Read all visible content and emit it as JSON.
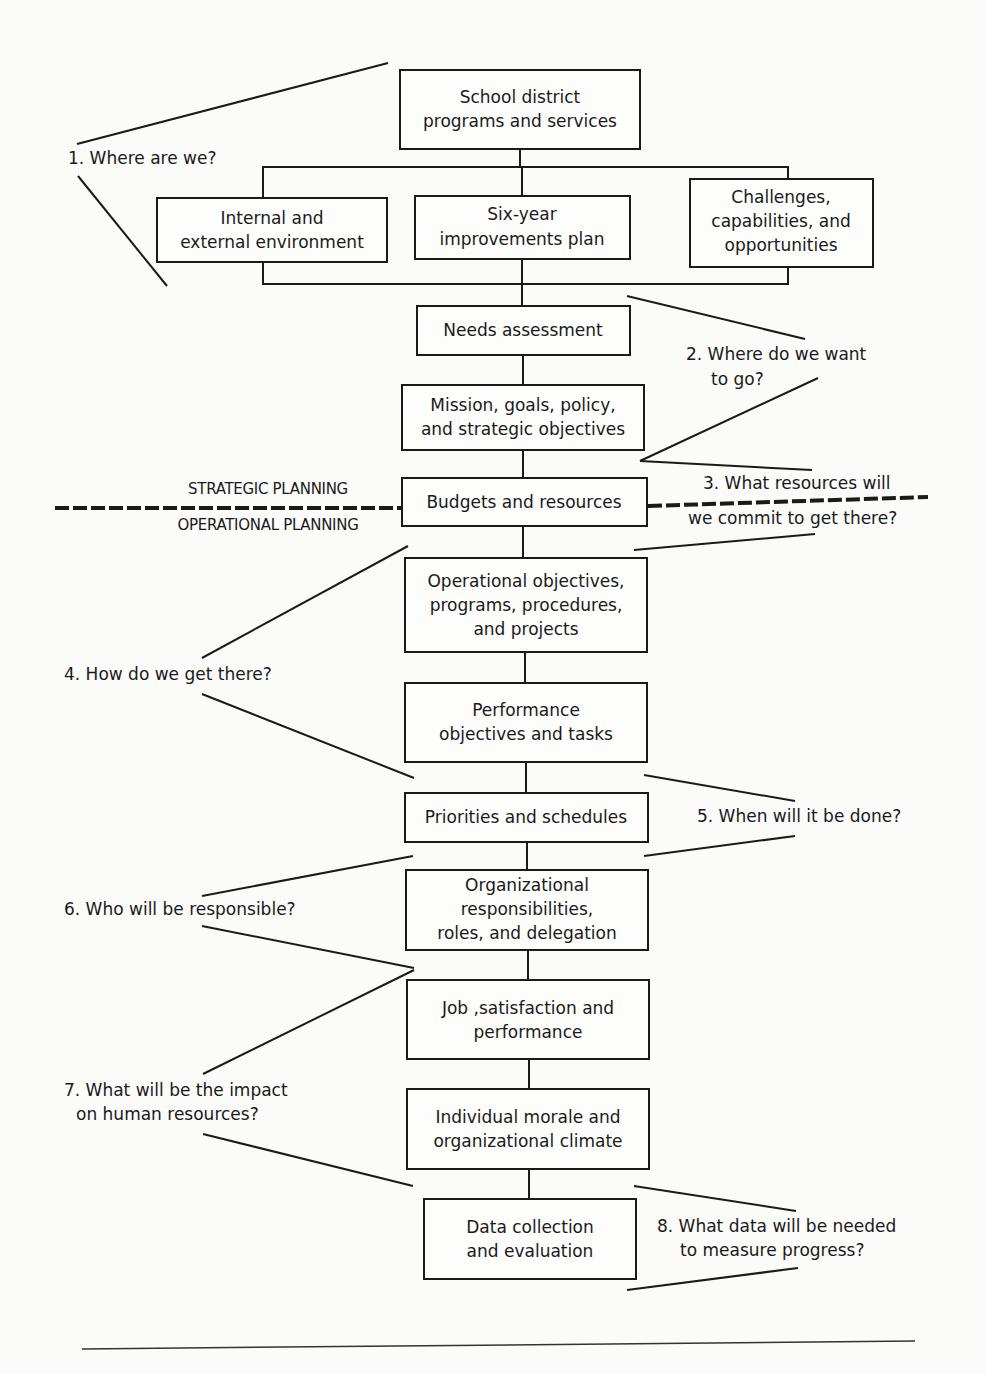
{
  "diagram": {
    "boxes": {
      "school_district": [
        "School district",
        "programs and services"
      ],
      "internal_external": [
        "Internal and",
        "external environment"
      ],
      "six_year": [
        "Six-year",
        "improvements plan"
      ],
      "challenges": [
        "Challenges,",
        "capabilities, and",
        "opportunities"
      ],
      "needs": [
        "Needs assessment"
      ],
      "mission": [
        "Mission, goals, policy,",
        "and strategic objectives"
      ],
      "budgets": [
        "Budgets and resources"
      ],
      "operational": [
        "Operational objectives,",
        "programs, procedures,",
        "and projects"
      ],
      "performance": [
        "Performance",
        "objectives and tasks"
      ],
      "priorities": [
        "Priorities and schedules"
      ],
      "organizational": [
        "Organizational",
        "responsibilities,",
        "roles, and delegation"
      ],
      "job": [
        "Job ,satisfaction and",
        "performance"
      ],
      "morale": [
        "Individual morale and",
        "organizational climate"
      ],
      "data": [
        "Data collection",
        "and evaluation"
      ]
    },
    "questions": {
      "q1": [
        "1. Where are we?"
      ],
      "q2": [
        "2. Where do we want",
        "to go?"
      ],
      "q3": [
        "3. What resources will",
        "we commit to get there?"
      ],
      "q4": [
        "4. How do we get there?"
      ],
      "q5": [
        "5. When will it be done?"
      ],
      "q6": [
        "6. Who will be responsible?"
      ],
      "q7": [
        "7. What will be the impact",
        "on human resources?"
      ],
      "q8": [
        "8. What data will be needed",
        "to measure progress?"
      ]
    },
    "divider_labels": {
      "strategic": "STRATEGIC PLANNING",
      "operational": "OPERATIONAL PLANNING"
    }
  }
}
